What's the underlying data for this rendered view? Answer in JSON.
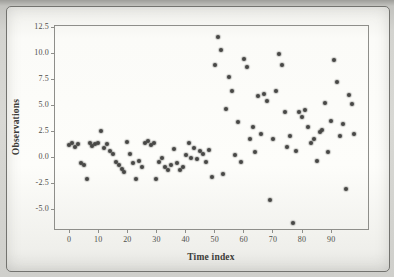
{
  "figure": {
    "background_color": "#d3d3cf",
    "panel_color": "#fdfdfa",
    "border_color": "#73736f"
  },
  "chart_data": {
    "type": "scatter",
    "title": "",
    "xlabel": "Time index",
    "ylabel": "Observations",
    "xlim": [
      -5.2,
      103
    ],
    "ylim": [
      -7.0,
      12.7
    ],
    "x_ticks": [
      0,
      10,
      20,
      30,
      40,
      50,
      60,
      70,
      80,
      90
    ],
    "y_ticks": [
      12.5,
      10.0,
      7.5,
      5.0,
      2.5,
      0.0,
      -2.5,
      -5.0
    ],
    "grid": false,
    "legend": "none",
    "point_color": "#474745",
    "frame_color": "#8e8e8a",
    "points": [
      [
        0,
        1.2
      ],
      [
        1,
        1.4
      ],
      [
        2,
        1.0
      ],
      [
        3,
        1.3
      ],
      [
        4,
        -0.6
      ],
      [
        5,
        -0.8
      ],
      [
        6,
        -2.1
      ],
      [
        7,
        1.4
      ],
      [
        8,
        1.1
      ],
      [
        9,
        1.3
      ],
      [
        10,
        1.4
      ],
      [
        11,
        2.5
      ],
      [
        12,
        0.9
      ],
      [
        13,
        1.3
      ],
      [
        14,
        0.6
      ],
      [
        15,
        0.3
      ],
      [
        16,
        -0.5
      ],
      [
        17,
        -0.8
      ],
      [
        18,
        -1.1
      ],
      [
        19,
        -1.4
      ],
      [
        20,
        1.5
      ],
      [
        21,
        0.3
      ],
      [
        22,
        -0.6
      ],
      [
        23,
        -2.1
      ],
      [
        24,
        -0.4
      ],
      [
        25,
        -0.9
      ],
      [
        26,
        1.4
      ],
      [
        27,
        1.6
      ],
      [
        28,
        1.2
      ],
      [
        29,
        1.4
      ],
      [
        30,
        -2.1
      ],
      [
        31,
        -0.5
      ],
      [
        32,
        -0.1
      ],
      [
        33,
        -0.9
      ],
      [
        34,
        -1.2
      ],
      [
        35,
        -0.8
      ],
      [
        36,
        0.8
      ],
      [
        37,
        -0.6
      ],
      [
        38,
        -1.2
      ],
      [
        39,
        -0.9
      ],
      [
        40,
        0.2
      ],
      [
        41,
        1.4
      ],
      [
        42,
        -0.1
      ],
      [
        43,
        0.9
      ],
      [
        44,
        -0.2
      ],
      [
        45,
        0.6
      ],
      [
        46,
        0.3
      ],
      [
        47,
        -0.5
      ],
      [
        48,
        0.7
      ],
      [
        49,
        -1.9
      ],
      [
        50,
        8.9
      ],
      [
        51,
        11.5
      ],
      [
        52,
        10.3
      ],
      [
        53,
        -1.6
      ],
      [
        54,
        4.6
      ],
      [
        55,
        7.7
      ],
      [
        56,
        6.4
      ],
      [
        57,
        0.2
      ],
      [
        58,
        3.4
      ],
      [
        59,
        -0.5
      ],
      [
        60,
        9.4
      ],
      [
        61,
        8.7
      ],
      [
        62,
        1.7
      ],
      [
        63,
        2.9
      ],
      [
        64,
        0.5
      ],
      [
        65,
        5.9
      ],
      [
        66,
        2.2
      ],
      [
        67,
        6.1
      ],
      [
        68,
        5.4
      ],
      [
        69,
        -4.1
      ],
      [
        70,
        1.7
      ],
      [
        71,
        6.4
      ],
      [
        72,
        9.9
      ],
      [
        73,
        8.9
      ],
      [
        74,
        4.3
      ],
      [
        75,
        1.0
      ],
      [
        76,
        2.0
      ],
      [
        77,
        -6.3
      ],
      [
        78,
        0.6
      ],
      [
        79,
        4.3
      ],
      [
        80,
        3.9
      ],
      [
        81,
        4.5
      ],
      [
        82,
        2.9
      ],
      [
        83,
        1.4
      ],
      [
        84,
        1.7
      ],
      [
        85,
        -0.4
      ],
      [
        86,
        2.4
      ],
      [
        87,
        2.6
      ],
      [
        88,
        5.2
      ],
      [
        89,
        0.5
      ],
      [
        90,
        3.5
      ],
      [
        91,
        9.3
      ],
      [
        92,
        7.2
      ],
      [
        93,
        2.0
      ],
      [
        94,
        3.2
      ],
      [
        95,
        -3.1
      ],
      [
        96,
        6.0
      ],
      [
        97,
        5.1
      ],
      [
        98,
        2.2
      ]
    ]
  }
}
